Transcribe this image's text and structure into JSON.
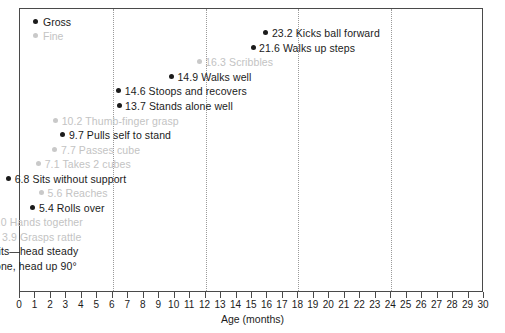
{
  "chart_data": {
    "type": "scatter",
    "title": "",
    "xlabel": "Age (months)",
    "ylabel": "",
    "xlim": [
      0,
      30
    ],
    "xticks": [
      0,
      1,
      2,
      3,
      4,
      5,
      6,
      7,
      8,
      9,
      10,
      11,
      12,
      13,
      14,
      15,
      16,
      17,
      18,
      19,
      20,
      21,
      22,
      23,
      24,
      25,
      26,
      27,
      28,
      29,
      30
    ],
    "xtick_labels": [
      "0",
      "1",
      "2",
      "3",
      "4",
      "5",
      "6",
      "7",
      "8",
      "9",
      "10",
      "11",
      "12",
      "13",
      "14",
      "15",
      "16",
      "17",
      "18",
      "19",
      "20",
      "21",
      "22",
      "23",
      "24",
      "25",
      "26",
      "27",
      "28",
      "29",
      "30"
    ],
    "gridlines_x": [
      6,
      12,
      18,
      24
    ],
    "grid": "vertical-dotted",
    "legend_position": "top-left",
    "series": [
      {
        "name": "Gross",
        "color": "#1b1b1b"
      },
      {
        "name": "Fine",
        "color": "#c9c9c9"
      }
    ],
    "points": [
      {
        "value": 23.2,
        "label": "Kicks ball forward",
        "text": "23.2 Kicks ball forward",
        "series": "Gross"
      },
      {
        "value": 21.6,
        "label": "Walks up steps",
        "text": "21.6 Walks up steps",
        "series": "Gross"
      },
      {
        "value": 16.3,
        "label": "Scribbles",
        "text": "16.3 Scribbles",
        "series": "Fine"
      },
      {
        "value": 14.9,
        "label": "Walks well",
        "text": "14.9 Walks well",
        "series": "Gross"
      },
      {
        "value": 14.6,
        "label": "Stoops and recovers",
        "text": "14.6 Stoops and recovers",
        "series": "Gross"
      },
      {
        "value": 13.7,
        "label": "Stands alone well",
        "text": "13.7 Stands alone well",
        "series": "Gross"
      },
      {
        "value": 10.2,
        "label": "Thumb-finger grasp",
        "text": "10.2 Thumb-finger grasp",
        "series": "Fine"
      },
      {
        "value": 9.7,
        "label": "Pulls self to stand",
        "text": "9.7 Pulls self to stand",
        "series": "Gross"
      },
      {
        "value": 7.7,
        "label": "Passes cube",
        "text": "7.7 Passes cube",
        "series": "Fine"
      },
      {
        "value": 7.1,
        "label": "Takes 2 cubes",
        "text": "7.1 Takes 2 cubes",
        "series": "Fine"
      },
      {
        "value": 6.8,
        "label": "Sits without support",
        "text": "6.8 Sits without support",
        "series": "Gross"
      },
      {
        "value": 5.6,
        "label": "Reaches",
        "text": "5.6 Reaches",
        "series": "Fine"
      },
      {
        "value": 5.4,
        "label": "Rolls over",
        "text": "5.4 Rolls over",
        "series": "Gross"
      },
      {
        "value": 4.0,
        "label": "Hands together",
        "text": "4.0 Hands together",
        "series": "Fine"
      },
      {
        "value": 3.9,
        "label": "Grasps rattle",
        "text": "3.9 Grasps rattle",
        "series": "Fine"
      },
      {
        "value": 3.7,
        "label": "Sits—head steady",
        "text": "3.7 Sits—head steady",
        "series": "Gross"
      },
      {
        "value": 3.6,
        "label": "Prone, head up 90°",
        "text": "3.6 Prone, head up 90°",
        "series": "Gross"
      }
    ]
  },
  "legend": {
    "items": [
      {
        "label": "Gross",
        "color": "#1b1b1b"
      },
      {
        "label": "Fine",
        "color": "#c9c9c9"
      }
    ]
  },
  "axis": {
    "title": "Age (months)"
  }
}
